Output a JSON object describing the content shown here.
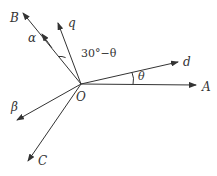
{
  "diagram": {
    "type": "vector-angle-diagram",
    "origin": {
      "label": "O",
      "x": 81,
      "y": 84
    },
    "colors": {
      "line": "#333333",
      "background": "#ffffff"
    },
    "vectors": [
      {
        "id": "A",
        "label": "A",
        "tip": [
          196,
          85
        ],
        "label_pos": [
          202,
          91
        ]
      },
      {
        "id": "d",
        "label": "d",
        "tip": [
          178,
          62
        ],
        "label_pos": [
          183,
          66
        ]
      },
      {
        "id": "q",
        "label": "q",
        "tip": [
          58,
          23
        ],
        "label_pos": [
          68,
          27
        ]
      },
      {
        "id": "B",
        "label": "B",
        "tip": [
          23,
          13
        ],
        "label_pos": [
          10,
          22
        ]
      },
      {
        "id": "beta",
        "label": "β",
        "tip": [
          17,
          120
        ],
        "label_pos": [
          11,
          111
        ]
      },
      {
        "id": "C",
        "label": "C",
        "tip": [
          28,
          161
        ],
        "label_pos": [
          38,
          165
        ]
      }
    ],
    "mid_arrow": {
      "on": "B",
      "label": "α",
      "at": [
        42,
        34
      ],
      "label_pos": [
        28,
        42
      ]
    },
    "angles": [
      {
        "between": [
          "q",
          "B"
        ],
        "label": "30°−θ",
        "label_pos": [
          81,
          57
        ]
      },
      {
        "between": [
          "A",
          "d"
        ],
        "label": "θ",
        "label_pos": [
          138,
          80
        ]
      }
    ]
  }
}
